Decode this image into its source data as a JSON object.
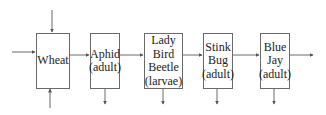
{
  "diagram": {
    "type": "food-chain",
    "nodes": [
      {
        "id": "wheat",
        "lines": [
          "Wheat"
        ]
      },
      {
        "id": "aphid",
        "lines": [
          "Aphid",
          "(adult)"
        ]
      },
      {
        "id": "ladybird",
        "lines": [
          "Lady",
          "Bird",
          "Beetle",
          "(larvae)"
        ]
      },
      {
        "id": "stinkbug",
        "lines": [
          "Stink",
          "Bug",
          "(adult)"
        ]
      },
      {
        "id": "bluejay",
        "lines": [
          "Blue",
          "Jay",
          "(adult)"
        ]
      }
    ],
    "edges": [
      {
        "from": "wheat",
        "to": "aphid"
      },
      {
        "from": "aphid",
        "to": "ladybird"
      },
      {
        "from": "ladybird",
        "to": "stinkbug"
      },
      {
        "from": "stinkbug",
        "to": "bluejay"
      }
    ],
    "colors": {
      "line": "#6a6a6a",
      "text": "#222222",
      "background": "#ffffff"
    }
  }
}
